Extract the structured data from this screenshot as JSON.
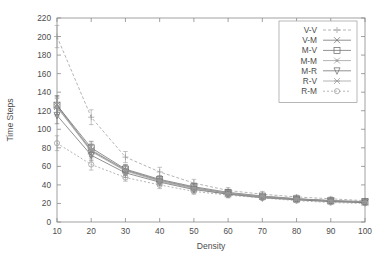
{
  "chart_data": {
    "type": "line",
    "title": "",
    "xlabel": "Density",
    "ylabel": "Time Steps",
    "xlim": [
      10,
      100
    ],
    "ylim": [
      0,
      220
    ],
    "xticks": [
      10,
      20,
      30,
      40,
      50,
      60,
      70,
      80,
      90,
      100
    ],
    "yticks": [
      0,
      20,
      40,
      60,
      80,
      100,
      120,
      140,
      160,
      180,
      200,
      220
    ],
    "grid": false,
    "legend_position": "top-right",
    "error_bars": true,
    "x": [
      10,
      20,
      30,
      40,
      50,
      60,
      70,
      80,
      90,
      100
    ],
    "series": [
      {
        "name": "V-V",
        "marker": "plus",
        "dash": "3,2",
        "values": [
          200,
          113,
          70,
          54,
          42,
          34,
          30,
          27,
          25,
          23
        ],
        "err": [
          12,
          8,
          6,
          5,
          4,
          3,
          3,
          2,
          2,
          2
        ]
      },
      {
        "name": "V-M",
        "marker": "cross",
        "dash": "none",
        "values": [
          126,
          77,
          56,
          45,
          37,
          31,
          27,
          25,
          23,
          21
        ],
        "err": [
          10,
          6,
          5,
          4,
          3,
          3,
          2,
          2,
          2,
          2
        ]
      },
      {
        "name": "M-V",
        "marker": "square",
        "dash": "none",
        "values": [
          126,
          80,
          57,
          46,
          38,
          32,
          28,
          25,
          23,
          22
        ],
        "err": [
          10,
          7,
          5,
          4,
          3,
          3,
          2,
          2,
          2,
          2
        ]
      },
      {
        "name": "M-M",
        "marker": "dot-cross",
        "dash": "none",
        "values": [
          124,
          76,
          55,
          44,
          36,
          30,
          27,
          24,
          22,
          21
        ],
        "err": [
          9,
          6,
          5,
          4,
          3,
          3,
          2,
          2,
          2,
          2
        ]
      },
      {
        "name": "M-R",
        "marker": "tri-down",
        "dash": "none",
        "values": [
          115,
          72,
          53,
          43,
          35,
          30,
          26,
          24,
          22,
          21
        ],
        "err": [
          9,
          6,
          5,
          4,
          3,
          3,
          2,
          2,
          2,
          2
        ]
      },
      {
        "name": "R-V",
        "marker": "asterisk",
        "dash": "none",
        "values": [
          124,
          78,
          56,
          45,
          37,
          31,
          28,
          25,
          23,
          22
        ],
        "err": [
          10,
          7,
          5,
          4,
          3,
          3,
          2,
          2,
          2,
          2
        ]
      },
      {
        "name": "R-M",
        "marker": "circle",
        "dash": "2,2",
        "values": [
          85,
          62,
          48,
          40,
          33,
          29,
          26,
          23,
          21,
          20
        ],
        "err": [
          8,
          6,
          4,
          4,
          3,
          3,
          2,
          2,
          2,
          2
        ]
      }
    ]
  },
  "colors": {
    "axis": "#8a8a8a",
    "text": "#4d4d4d",
    "background": "#ffffff",
    "series_gray": "#9b9b9b",
    "series_dark": "#6e6e6e"
  }
}
